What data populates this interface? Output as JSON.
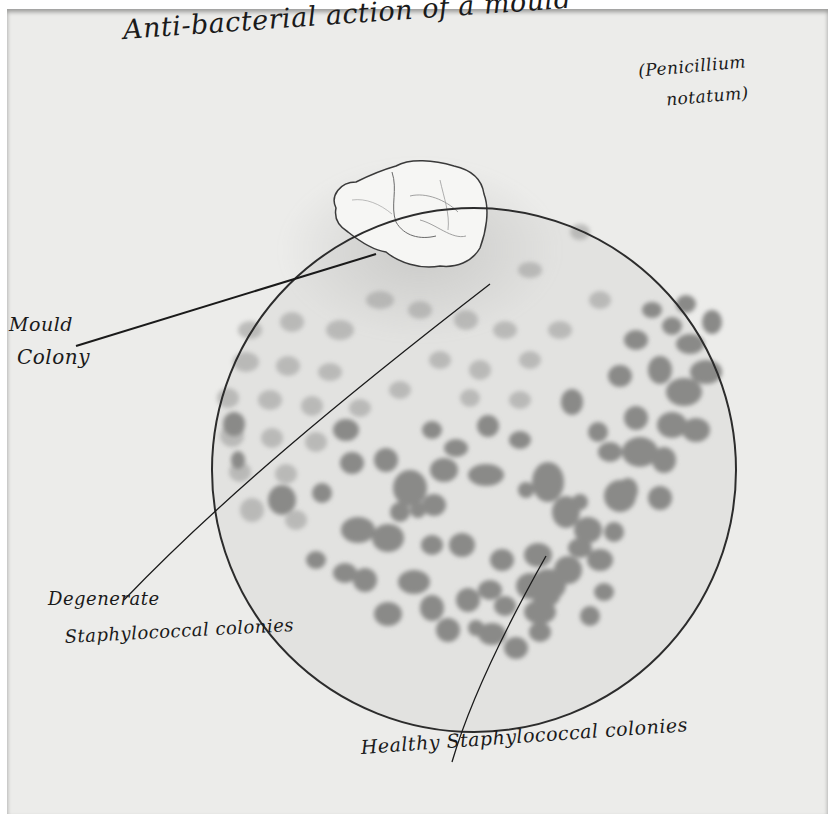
{
  "figure": {
    "title": "Anti-bacterial action of a mould",
    "subtitle_line1": "(Penicillium",
    "subtitle_line2": "notatum)",
    "background_color": "#ececea",
    "ink_color": "#1a1a1a",
    "colony_color": "#8a8a88"
  },
  "labels": {
    "mould_colony_line1": "Mould",
    "mould_colony_line2": "Colony",
    "degenerate_line1": "Degenerate",
    "degenerate_line2": "Staphylococcal colonies",
    "healthy": "Healthy Staphylococcal colonies"
  },
  "elements": {
    "culture_plate": "circular petri dish outline",
    "mould_colony": "white irregular mould colony at upper-left of plate",
    "degenerate_colonies": "faint, pale colonies near the mould",
    "healthy_colonies": "dark, dense colonies far from the mould"
  }
}
